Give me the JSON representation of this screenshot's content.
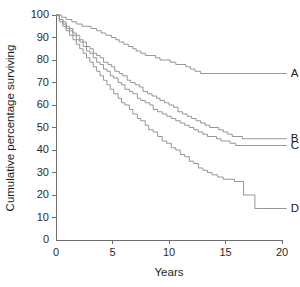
{
  "chart_data": {
    "type": "line",
    "title": "",
    "subtitle": "",
    "xlabel": "Years",
    "ylabel": "Cumulative percentage surviving",
    "xlim": [
      0,
      20
    ],
    "ylim": [
      0,
      100
    ],
    "xticks": [
      0,
      5,
      10,
      15,
      20
    ],
    "xtick_labels": [
      "0",
      "5",
      "10",
      "15",
      "20"
    ],
    "yticks": [
      0,
      10,
      20,
      30,
      40,
      50,
      60,
      70,
      80,
      90,
      100
    ],
    "ytick_labels": [
      "0",
      "10",
      "20",
      "30",
      "40",
      "50",
      "60",
      "70",
      "80",
      "90",
      "100"
    ],
    "grid": false,
    "legend_position": "right-inline-labels",
    "step_style": "post",
    "series": [
      {
        "name": "A",
        "label": "A",
        "label_x": 20.6,
        "label_y": 74,
        "color": "#8a8a8a",
        "points": [
          [
            0.0,
            100
          ],
          [
            0.5,
            99
          ],
          [
            0.9,
            98
          ],
          [
            1.4,
            97
          ],
          [
            1.8,
            96
          ],
          [
            2.3,
            95
          ],
          [
            2.7,
            95
          ],
          [
            3.1,
            94
          ],
          [
            3.6,
            93
          ],
          [
            4.0,
            92
          ],
          [
            4.4,
            91
          ],
          [
            4.9,
            90
          ],
          [
            5.3,
            89
          ],
          [
            5.6,
            88
          ],
          [
            6.0,
            87
          ],
          [
            6.4,
            86
          ],
          [
            6.8,
            85
          ],
          [
            7.1,
            84
          ],
          [
            7.5,
            83
          ],
          [
            7.9,
            82
          ],
          [
            8.3,
            82
          ],
          [
            8.8,
            81
          ],
          [
            9.2,
            80
          ],
          [
            9.7,
            80
          ],
          [
            10.1,
            79
          ],
          [
            10.6,
            78
          ],
          [
            11.0,
            78
          ],
          [
            11.5,
            77
          ],
          [
            11.9,
            76
          ],
          [
            12.3,
            75
          ],
          [
            12.8,
            74
          ],
          [
            13.2,
            74
          ],
          [
            19.4,
            74
          ]
        ]
      },
      {
        "name": "B",
        "label": "B",
        "label_x": 20.6,
        "label_y": 45,
        "color": "#8a8a8a",
        "points": [
          [
            0.0,
            100
          ],
          [
            0.3,
            98
          ],
          [
            0.6,
            97
          ],
          [
            0.9,
            95
          ],
          [
            1.2,
            94
          ],
          [
            1.5,
            92
          ],
          [
            1.8,
            91
          ],
          [
            2.1,
            89
          ],
          [
            2.4,
            88
          ],
          [
            2.7,
            86
          ],
          [
            3.0,
            85
          ],
          [
            3.3,
            83
          ],
          [
            3.6,
            82
          ],
          [
            3.9,
            81
          ],
          [
            4.2,
            79
          ],
          [
            4.6,
            78
          ],
          [
            4.9,
            77
          ],
          [
            5.2,
            75
          ],
          [
            5.6,
            74
          ],
          [
            5.9,
            73
          ],
          [
            6.3,
            71
          ],
          [
            6.6,
            70
          ],
          [
            7.0,
            69
          ],
          [
            7.4,
            68
          ],
          [
            7.7,
            66
          ],
          [
            8.1,
            65
          ],
          [
            8.5,
            64
          ],
          [
            8.9,
            63
          ],
          [
            9.2,
            62
          ],
          [
            9.6,
            61
          ],
          [
            10.0,
            60
          ],
          [
            10.4,
            59
          ],
          [
            10.8,
            57
          ],
          [
            11.2,
            56
          ],
          [
            11.6,
            55
          ],
          [
            12.0,
            54
          ],
          [
            12.4,
            53
          ],
          [
            12.8,
            52
          ],
          [
            13.2,
            51
          ],
          [
            13.6,
            50
          ],
          [
            14.0,
            50
          ],
          [
            14.4,
            49
          ],
          [
            14.8,
            48
          ],
          [
            15.2,
            47
          ],
          [
            15.6,
            46
          ],
          [
            16.0,
            46
          ],
          [
            16.5,
            45
          ],
          [
            19.4,
            45
          ]
        ]
      },
      {
        "name": "C",
        "label": "C",
        "label_x": 20.6,
        "label_y": 42,
        "color": "#8a8a8a",
        "points": [
          [
            0.0,
            100
          ],
          [
            0.3,
            98
          ],
          [
            0.6,
            96
          ],
          [
            0.9,
            94
          ],
          [
            1.2,
            93
          ],
          [
            1.5,
            91
          ],
          [
            1.8,
            89
          ],
          [
            2.1,
            88
          ],
          [
            2.4,
            86
          ],
          [
            2.7,
            84
          ],
          [
            3.0,
            83
          ],
          [
            3.3,
            81
          ],
          [
            3.6,
            79
          ],
          [
            3.9,
            78
          ],
          [
            4.2,
            76
          ],
          [
            4.5,
            75
          ],
          [
            4.8,
            73
          ],
          [
            5.1,
            72
          ],
          [
            5.5,
            70
          ],
          [
            5.8,
            69
          ],
          [
            6.1,
            67
          ],
          [
            6.5,
            66
          ],
          [
            6.8,
            65
          ],
          [
            7.2,
            63
          ],
          [
            7.5,
            62
          ],
          [
            7.9,
            61
          ],
          [
            8.3,
            60
          ],
          [
            8.6,
            58
          ],
          [
            9.0,
            57
          ],
          [
            9.4,
            56
          ],
          [
            9.8,
            55
          ],
          [
            10.2,
            54
          ],
          [
            10.6,
            53
          ],
          [
            11.0,
            52
          ],
          [
            11.4,
            51
          ],
          [
            11.8,
            50
          ],
          [
            12.2,
            49
          ],
          [
            12.6,
            48
          ],
          [
            13.0,
            47
          ],
          [
            13.4,
            46
          ],
          [
            13.8,
            46
          ],
          [
            14.2,
            45
          ],
          [
            14.6,
            44
          ],
          [
            15.0,
            44
          ],
          [
            15.4,
            43
          ],
          [
            15.9,
            42
          ],
          [
            19.4,
            42
          ]
        ]
      },
      {
        "name": "D",
        "label": "D",
        "label_x": 20.6,
        "label_y": 14,
        "color": "#8a8a8a",
        "points": [
          [
            0.0,
            100
          ],
          [
            0.3,
            97
          ],
          [
            0.6,
            95
          ],
          [
            0.9,
            93
          ],
          [
            1.2,
            91
          ],
          [
            1.5,
            89
          ],
          [
            1.8,
            87
          ],
          [
            2.1,
            85
          ],
          [
            2.4,
            83
          ],
          [
            2.7,
            81
          ],
          [
            3.0,
            79
          ],
          [
            3.3,
            77
          ],
          [
            3.6,
            75
          ],
          [
            3.9,
            73
          ],
          [
            4.2,
            71
          ],
          [
            4.5,
            69
          ],
          [
            4.8,
            67
          ],
          [
            5.1,
            65
          ],
          [
            5.5,
            63
          ],
          [
            5.8,
            61
          ],
          [
            6.1,
            60
          ],
          [
            6.5,
            58
          ],
          [
            6.8,
            56
          ],
          [
            7.2,
            54
          ],
          [
            7.5,
            53
          ],
          [
            7.9,
            51
          ],
          [
            8.2,
            49
          ],
          [
            8.6,
            48
          ],
          [
            9.0,
            46
          ],
          [
            9.4,
            44
          ],
          [
            9.8,
            43
          ],
          [
            10.2,
            41
          ],
          [
            10.6,
            40
          ],
          [
            11.0,
            38
          ],
          [
            11.4,
            37
          ],
          [
            11.8,
            35
          ],
          [
            12.2,
            34
          ],
          [
            12.6,
            32
          ],
          [
            13.0,
            31
          ],
          [
            13.4,
            30
          ],
          [
            13.8,
            29
          ],
          [
            14.3,
            28
          ],
          [
            14.8,
            27
          ],
          [
            15.3,
            27
          ],
          [
            15.8,
            26
          ],
          [
            16.3,
            26
          ],
          [
            16.6,
            20
          ],
          [
            17.3,
            20
          ],
          [
            17.6,
            14
          ],
          [
            18.2,
            14
          ]
        ]
      }
    ]
  }
}
